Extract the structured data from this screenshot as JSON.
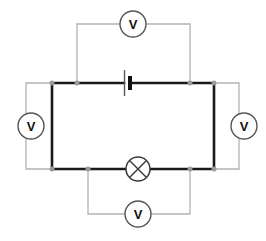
{
  "diagram": {
    "type": "circuit-schematic",
    "background_color": "#ffffff",
    "main_wire_color": "#1a1a1a",
    "branch_wire_color": "#b3b3b3",
    "junction_color": "#9a9a9a",
    "component_stroke_color": "#3a3a3a",
    "main_loop": {
      "left_x": 52,
      "right_x": 214,
      "top_y": 83,
      "bottom_y": 169,
      "stroke_width": 2.6
    },
    "components": [
      {
        "id": "battery",
        "name": "battery",
        "symbol": "cell",
        "label": "",
        "x": 127,
        "y": 83,
        "long_plate_height": 26,
        "short_plate_height": 14,
        "plate_gap": 6
      },
      {
        "id": "lamp",
        "name": "lamp",
        "symbol": "circle-with-cross",
        "label": "",
        "x": 138,
        "y": 169,
        "radius": 12
      }
    ],
    "voltmeters": [
      {
        "id": "voltmeter-top",
        "position": "top",
        "label": "V",
        "cx": 133,
        "cy": 24,
        "radius": 13,
        "branch": {
          "from_x": 77,
          "to_x": 190,
          "rail_y": 24,
          "tap_y": 83
        }
      },
      {
        "id": "voltmeter-right",
        "position": "right",
        "label": "V",
        "cx": 244,
        "cy": 126,
        "radius": 13,
        "branch": {
          "from_y": 83,
          "to_y": 169,
          "rail_x": 239,
          "tap_x": 214
        }
      },
      {
        "id": "voltmeter-bottom",
        "position": "bottom",
        "label": "V",
        "cx": 138,
        "cy": 214,
        "radius": 13,
        "branch": {
          "from_x": 88,
          "to_x": 190,
          "rail_y": 214,
          "tap_y": 169
        }
      },
      {
        "id": "voltmeter-left",
        "position": "left",
        "label": "V",
        "cx": 31,
        "cy": 126,
        "radius": 13,
        "branch": {
          "from_y": 83,
          "to_y": 169,
          "rail_x": 26,
          "tap_x": 52
        }
      }
    ],
    "junctions": [
      {
        "id": "junction-top-left-corner",
        "x": 52,
        "y": 83
      },
      {
        "id": "junction-top-left-tap",
        "x": 77,
        "y": 83
      },
      {
        "id": "junction-top-right-tap",
        "x": 190,
        "y": 83
      },
      {
        "id": "junction-top-right-corner",
        "x": 214,
        "y": 83
      },
      {
        "id": "junction-bottom-left-corner",
        "x": 52,
        "y": 169
      },
      {
        "id": "junction-bottom-left-tap",
        "x": 88,
        "y": 169
      },
      {
        "id": "junction-bottom-right-tap",
        "x": 190,
        "y": 169
      },
      {
        "id": "junction-bottom-right-corner",
        "x": 214,
        "y": 169
      }
    ]
  }
}
